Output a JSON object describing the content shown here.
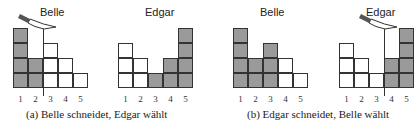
{
  "figure": {
    "panels": [
      {
        "id": "a",
        "caption": "(a) Belle schneidet, Edgar wählt",
        "left": {
          "label": "Belle",
          "heights": [
            4,
            2,
            3,
            2,
            1
          ],
          "shaded": [
            4,
            2,
            0,
            0,
            0
          ],
          "knife": true,
          "cut_after": 2
        },
        "right": {
          "label": "Edgar",
          "heights": [
            3,
            2,
            1,
            2,
            4
          ],
          "shaded": [
            0,
            0,
            1,
            2,
            4
          ],
          "knife": false
        },
        "ticks": [
          "1",
          "2",
          "3",
          "4",
          "5"
        ]
      },
      {
        "id": "b",
        "caption": "(b) Edgar schneidet, Belle wählt",
        "left": {
          "label": "Belle",
          "heights": [
            4,
            2,
            3,
            2,
            1
          ],
          "shaded": [
            4,
            2,
            3,
            0,
            0
          ],
          "knife": false
        },
        "right": {
          "label": "Edgar",
          "heights": [
            3,
            2,
            1,
            2,
            4
          ],
          "shaded": [
            0,
            0,
            0,
            2,
            4
          ],
          "knife": true,
          "cut_after": 3
        },
        "ticks": [
          "1",
          "2",
          "3",
          "4",
          "5"
        ]
      }
    ]
  }
}
